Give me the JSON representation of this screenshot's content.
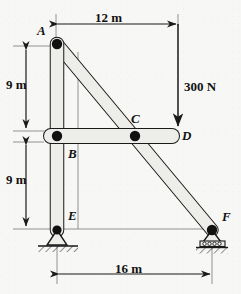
{
  "figure": {
    "type": "truss-free-body-diagram",
    "title": "",
    "background_color": "#f7f7f5",
    "ink_color": "#1a1a1a",
    "member_fill": "#e9e9e6"
  },
  "joints": [
    {
      "id": "A",
      "label": "A",
      "x": 57,
      "y": 44,
      "label_x": 38,
      "label_y": 30,
      "pin": true
    },
    {
      "id": "B",
      "label": "B",
      "x": 57,
      "y": 136,
      "label_x": 68,
      "label_y": 150,
      "pin": true
    },
    {
      "id": "C",
      "label": "C",
      "x": 135,
      "y": 136,
      "label_x": 132,
      "label_y": 116,
      "pin": true
    },
    {
      "id": "D",
      "label": "D",
      "x": 178,
      "y": 136,
      "label_x": 182,
      "label_y": 132,
      "pin": false
    },
    {
      "id": "E",
      "label": "E",
      "x": 57,
      "y": 230,
      "label_x": 68,
      "label_y": 213,
      "pin": true
    },
    {
      "id": "F",
      "label": "F",
      "x": 212,
      "y": 230,
      "label_x": 221,
      "label_y": 214,
      "pin": true
    }
  ],
  "members": [
    {
      "id": "AE",
      "from": "A",
      "to": "E",
      "orientation": "vertical"
    },
    {
      "id": "BD",
      "from": "B",
      "to": "D",
      "orientation": "horizontal"
    },
    {
      "id": "AF",
      "from": "A",
      "to": "F",
      "orientation": "diagonal"
    }
  ],
  "supports": [
    {
      "at": "E",
      "type": "pin-support",
      "hatched": true
    },
    {
      "at": "F",
      "type": "roller-support",
      "hatched": true,
      "rollers": 4
    }
  ],
  "load": {
    "label": "300 N",
    "value": 300,
    "unit": "N",
    "direction": "down",
    "applied_at": "D",
    "arrow_x": 178,
    "arrow_top_y": 24,
    "arrow_tip_y": 127,
    "label_x": 184,
    "label_y": 87
  },
  "dimensions": [
    {
      "id": "top-12m",
      "label": "12 m",
      "value": 12,
      "unit": "m",
      "orientation": "horizontal",
      "x1": 56,
      "x2": 178,
      "y": 24,
      "label_x": 95,
      "label_y": 18
    },
    {
      "id": "left-9m-up",
      "label": "9 m",
      "value": 9,
      "unit": "m",
      "orientation": "vertical",
      "y1": 48,
      "y2": 130,
      "x": 26,
      "label_x": 8,
      "label_y": 84
    },
    {
      "id": "left-9m-dn",
      "label": "9 m",
      "value": 9,
      "unit": "m",
      "orientation": "vertical",
      "y1": 143,
      "y2": 228,
      "x": 26,
      "label_x": 8,
      "label_y": 180
    },
    {
      "id": "bottom-16m",
      "label": "16 m",
      "value": 16,
      "unit": "m",
      "orientation": "horizontal",
      "x1": 57,
      "x2": 212,
      "y": 274,
      "label_x": 118,
      "label_y": 268
    }
  ],
  "extension_lines": [
    {
      "id": "ext-top-left",
      "x1": 56,
      "y1": 14,
      "x2": 56,
      "y2": 46
    },
    {
      "id": "ext-top-right",
      "x1": 178,
      "y1": 14,
      "x2": 178,
      "y2": 24
    },
    {
      "id": "ext-left-upper",
      "x1": 13,
      "y1": 46,
      "x2": 50,
      "y2": 46
    },
    {
      "id": "ext-left-mid",
      "x1": 13,
      "y1": 131,
      "x2": 44,
      "y2": 131
    },
    {
      "id": "ext-left-mid2",
      "x1": 13,
      "y1": 142,
      "x2": 44,
      "y2": 142
    },
    {
      "id": "ext-left-low",
      "x1": 13,
      "y1": 229,
      "x2": 50,
      "y2": 229
    },
    {
      "id": "ext-E-to-F",
      "x1": 64,
      "y1": 229,
      "x2": 210,
      "y2": 229
    },
    {
      "id": "ext-bottom-left",
      "x1": 57,
      "y1": 240,
      "x2": 57,
      "y2": 284
    },
    {
      "id": "ext-bottom-right",
      "x1": 212,
      "y1": 243,
      "x2": 212,
      "y2": 284
    },
    {
      "id": "ext-vert-aux",
      "x1": 78,
      "y1": 52,
      "x2": 78,
      "y2": 229
    }
  ]
}
